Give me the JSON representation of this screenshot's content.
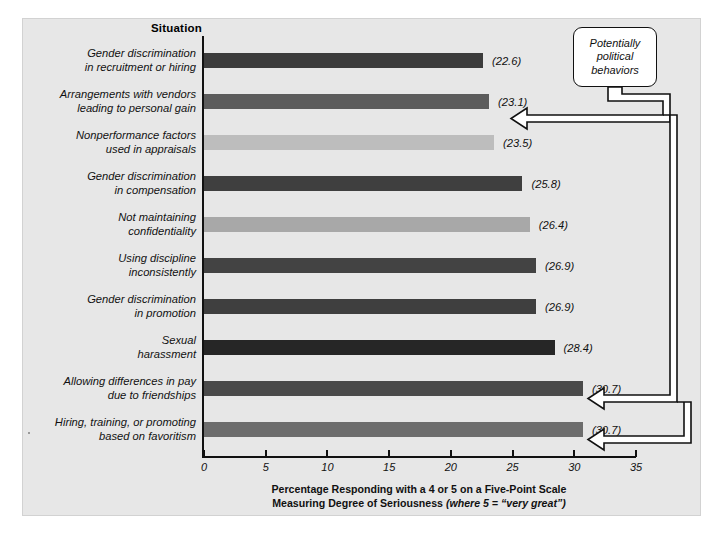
{
  "header": {
    "column_title": "Situation"
  },
  "callout": {
    "line1": "Potentially",
    "line2": "political",
    "line3": "behaviors"
  },
  "axis": {
    "title_line1": "Percentage Responding with a 4 or 5 on a Five-Point Scale",
    "title_line2_bold": "Measuring Degree of Seriousness ",
    "title_line2_italic": "(where 5 = “very great”)",
    "ticks": [
      "0",
      "5",
      "10",
      "15",
      "20",
      "25",
      "30",
      "35"
    ]
  },
  "colors": {
    "panel_background": "#e7e7e7",
    "axis": "#111111",
    "bar_darkest": "#262626",
    "bar_dark": "#3c3c3c",
    "bar_medium_dark": "#4e4e4e",
    "bar_medium": "#6d6d6d",
    "bar_light": "#a8a8a8",
    "bar_lightest": "#bdbdbd",
    "callout_fill": "#ffffff"
  },
  "chart_data": {
    "type": "bar",
    "orientation": "horizontal",
    "title": "",
    "xlabel": "Percentage Responding with a 4 or 5 on a Five-Point Scale Measuring Degree of Seriousness (where 5 = “very great”)",
    "ylabel": "Situation",
    "xlim": [
      0,
      35
    ],
    "grid": false,
    "legend": false,
    "categories": [
      "Gender discrimination in recruitment or hiring",
      "Arrangements with vendors leading to personal gain",
      "Nonperformance factors used in appraisals",
      "Gender discrimination in compensation",
      "Not maintaining confidentiality",
      "Using discipline inconsistently",
      "Gender discrimination in promotion",
      "Sexual harassment",
      "Allowing differences in pay due to friendships",
      "Hiring, training, or promoting based on favoritism"
    ],
    "values": [
      22.6,
      23.1,
      23.5,
      25.8,
      26.4,
      26.9,
      26.9,
      28.4,
      30.7,
      30.7
    ],
    "value_labels": [
      "(22.6)",
      "(23.1)",
      "(23.5)",
      "(25.8)",
      "(26.4)",
      "(26.9)",
      "(26.9)",
      "(28.4)",
      "(30.7)",
      "(30.7)"
    ],
    "bar_colors": [
      "#3c3c3c",
      "#5c5c5c",
      "#bdbdbd",
      "#3f3f3f",
      "#a8a8a8",
      "#434343",
      "#3f3f3f",
      "#262626",
      "#4a4a4a",
      "#6d6d6d"
    ],
    "annotations": [
      {
        "text": "Potentially political behaviors",
        "points_to": [
          1,
          8,
          9
        ]
      }
    ]
  },
  "rows": [
    {
      "label_line1": "Gender discrimination",
      "label_line2": "in recruitment or hiring",
      "value_label": "(22.6)"
    },
    {
      "label_line1": "Arrangements with vendors",
      "label_line2": "leading to personal gain",
      "value_label": "(23.1)"
    },
    {
      "label_line1": "Nonperformance factors",
      "label_line2": "used in appraisals",
      "value_label": "(23.5)"
    },
    {
      "label_line1": "Gender discrimination",
      "label_line2": "in compensation",
      "value_label": "(25.8)"
    },
    {
      "label_line1": "Not maintaining",
      "label_line2": "confidentiality",
      "value_label": "(26.4)"
    },
    {
      "label_line1": "Using discipline",
      "label_line2": "inconsistently",
      "value_label": "(26.9)"
    },
    {
      "label_line1": "Gender discrimination",
      "label_line2": "in promotion",
      "value_label": "(26.9)"
    },
    {
      "label_line1": "Sexual",
      "label_line2": "harassment",
      "value_label": "(28.4)"
    },
    {
      "label_line1": "Allowing differences in pay",
      "label_line2": "due to friendships",
      "value_label": "(30.7)"
    },
    {
      "label_line1": "Hiring, training, or promoting",
      "label_line2": "based on favoritism",
      "value_label": "(30.7)"
    }
  ]
}
